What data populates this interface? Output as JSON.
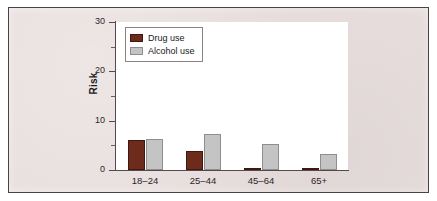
{
  "chart_data": {
    "type": "bar",
    "title": "",
    "subtitle": "",
    "xlabel": "",
    "ylabel": "Risk",
    "categories": [
      "18–24",
      "25–44",
      "45–64",
      "65+"
    ],
    "series": [
      {
        "name": "Drug use",
        "color": "#6d2b1c",
        "values": [
          6.1,
          3.9,
          0.5,
          0.5
        ]
      },
      {
        "name": "Alcohol use",
        "color": "#c4c4c4",
        "values": [
          6.3,
          7.3,
          5.2,
          3.3
        ]
      }
    ],
    "ylim": [
      0,
      30
    ],
    "y_ticks_major": [
      0,
      10,
      20,
      30
    ],
    "y_ticks_minor": [
      5,
      15,
      25
    ],
    "y_tick_labels": [
      "0",
      "10",
      "20",
      "30"
    ],
    "grid": false,
    "legend_position": "top-left",
    "legend_entries": [
      "Drug use",
      "Alcohol use"
    ]
  },
  "figure": {
    "background_color": "#e7dedd",
    "plot_background_color": "#ffffff",
    "axis_color": "#55494b",
    "border_color": "#4a4244"
  },
  "legend": {
    "items": [
      {
        "label": "Drug use",
        "swatch": "drug-swatch"
      },
      {
        "label": "Alcohol use",
        "swatch": "alcohol-swatch"
      }
    ]
  }
}
